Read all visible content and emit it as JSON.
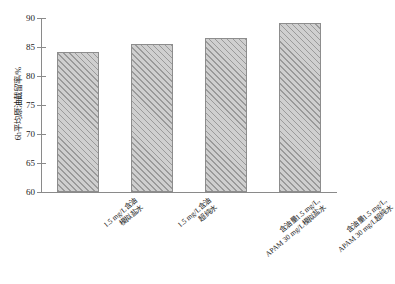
{
  "chart_data": {
    "type": "bar",
    "title": "",
    "xlabel": "",
    "ylabel": "6h平均原油截留率/%",
    "ylim": [
      60,
      90
    ],
    "yticks": [
      60,
      65,
      70,
      75,
      80,
      85,
      90
    ],
    "ytick_labels": [
      "60",
      "65",
      "70",
      "75",
      "80",
      "85",
      "90"
    ],
    "grid": false,
    "legend": null,
    "categories": [
      "1.5 mg/L含油\n模拟盐水",
      "1.5 mg/L含油\n超纯水",
      "含油量1.5 mg/L,\nAPAM 30 mg/L模拟盐水",
      "含油量1.5 mg/L,\nAPAM 30 mg/L超纯水"
    ],
    "category_lines": [
      [
        "1.5 mg/L含油",
        "模拟盐水"
      ],
      [
        "1.5 mg/L含油",
        "超纯水"
      ],
      [
        "含油量1.5 mg/L,",
        "APAM 30 mg/L模拟盐水"
      ],
      [
        "含油量1.5 mg/L,",
        "APAM 30 mg/L超纯水"
      ]
    ],
    "values": [
      84.1,
      85.5,
      86.5,
      89.1
    ],
    "bar_fill_color": "#c9c9c9",
    "bar_hatch_color": "#9a9a9a",
    "bar_edge_color": "#8d8d8d",
    "axis_color": "#8a8a8a",
    "hatch_pattern": "diagonal-up"
  }
}
